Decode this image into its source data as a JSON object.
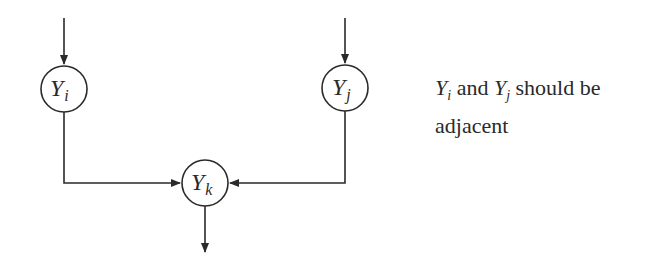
{
  "diagram": {
    "nodes": [
      {
        "id": "Yi",
        "base": "Y",
        "sub": "i",
        "cx": 64,
        "cy": 89
      },
      {
        "id": "Yj",
        "base": "Y",
        "sub": "j",
        "cx": 345,
        "cy": 88
      },
      {
        "id": "Yk",
        "base": "Y",
        "sub": "k",
        "cx": 205,
        "cy": 183
      }
    ],
    "edges": [
      {
        "from": "input",
        "to": "Yi"
      },
      {
        "from": "input",
        "to": "Yj"
      },
      {
        "from": "Yi",
        "to": "Yk"
      },
      {
        "from": "Yj",
        "to": "Yk"
      },
      {
        "from": "Yk",
        "to": "output"
      }
    ],
    "note": {
      "part1_base": "Y",
      "part1_sub": "i",
      "part2": " and ",
      "part3_base": "Y",
      "part3_sub": "j",
      "part4": " should be adjacent"
    },
    "colors": {
      "stroke": "#2a2a2a",
      "background": "#ffffff"
    }
  }
}
